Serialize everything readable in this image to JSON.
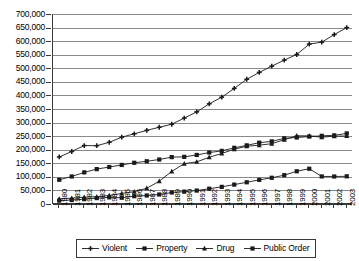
{
  "chart_data": {
    "type": "line",
    "title": "",
    "xlabel": "",
    "ylabel": "",
    "grid": true,
    "legend_position": "bottom",
    "ylim": [
      0,
      700000
    ],
    "ytick_step": 50000,
    "ytick_labels": [
      "700,000",
      "650,000",
      "600,000",
      "550,000",
      "500,000",
      "450,000",
      "400,000",
      "350,000",
      "300,000",
      "250,000",
      "200,000",
      "150,000",
      "100,000",
      "50,000",
      "0"
    ],
    "ytick_values": [
      700000,
      650000,
      600000,
      550000,
      500000,
      450000,
      400000,
      350000,
      300000,
      250000,
      200000,
      150000,
      100000,
      50000,
      0
    ],
    "categories": [
      "1980",
      "1981",
      "1982",
      "1983",
      "1984",
      "1985",
      "1986",
      "1987",
      "1988",
      "1989",
      "1990",
      "1991",
      "1992",
      "1993",
      "1994",
      "1995",
      "1996",
      "1997",
      "1998",
      "1999",
      "2000",
      "2001",
      "2002",
      "2003"
    ],
    "x": [
      1980,
      1981,
      1982,
      1983,
      1984,
      1985,
      1986,
      1987,
      1988,
      1989,
      1990,
      1991,
      1992,
      1993,
      1994,
      1995,
      1996,
      1997,
      1998,
      1999,
      2000,
      2001,
      2002,
      2003
    ],
    "series": [
      {
        "name": "Violent",
        "marker": "cross",
        "color": "#1a1a1a",
        "values": [
          173300,
          193500,
          215300,
          214800,
          227300,
          246200,
          258600,
          271300,
          282700,
          293900,
          316600,
          339500,
          369100,
          393500,
          425700,
          459600,
          484800,
          507800,
          529900,
          550800,
          589100,
          596100,
          624200,
          650000
        ]
      },
      {
        "name": "Property",
        "marker": "square",
        "color": "#1a1a1a",
        "values": [
          89300,
          101400,
          116500,
          128500,
          136300,
          143900,
          151900,
          157400,
          163900,
          172700,
          173700,
          180700,
          189600,
          195700,
          207000,
          216000,
          225900,
          230700,
          242000,
          245000,
          248500,
          251200,
          253000,
          260000
        ]
      },
      {
        "name": "Drug",
        "marker": "triangle",
        "color": "#1a1a1a",
        "values": [
          19000,
          21700,
          25300,
          26600,
          31300,
          38900,
          45400,
          57900,
          84000,
          120100,
          148600,
          155200,
          172300,
          186000,
          202000,
          212800,
          216900,
          222100,
          236800,
          251200,
          251100,
          246100,
          249900,
          250400
        ]
      },
      {
        "name": "Public Order",
        "marker": "square",
        "color": "#1a1a1a",
        "values": [
          12400,
          14600,
          17800,
          21700,
          24400,
          23000,
          28800,
          31300,
          35000,
          42400,
          45500,
          49500,
          56300,
          63100,
          71500,
          80000,
          88900,
          96600,
          106200,
          120600,
          129900,
          101600,
          101400,
          102000
        ]
      }
    ]
  },
  "legend": {
    "items": [
      {
        "label": "Violent",
        "marker": "cross"
      },
      {
        "label": "Property",
        "marker": "square"
      },
      {
        "label": "Drug",
        "marker": "triangle"
      },
      {
        "label": "Public Order",
        "marker": "square"
      }
    ]
  }
}
